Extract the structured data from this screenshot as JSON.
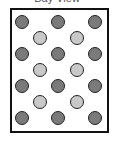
{
  "title": "Bay View",
  "colors": {
    "dark": "#7a7a7a",
    "light": "#c8c8c8",
    "border": "#111111"
  },
  "dots": [
    {
      "type": "dark",
      "x": 22,
      "y": 22
    },
    {
      "type": "dark",
      "x": 58,
      "y": 22
    },
    {
      "type": "dark",
      "x": 95,
      "y": 22
    },
    {
      "type": "light",
      "x": 40,
      "y": 38
    },
    {
      "type": "light",
      "x": 77,
      "y": 38
    },
    {
      "type": "dark",
      "x": 22,
      "y": 54
    },
    {
      "type": "dark",
      "x": 58,
      "y": 54
    },
    {
      "type": "dark",
      "x": 95,
      "y": 54
    },
    {
      "type": "light",
      "x": 40,
      "y": 70
    },
    {
      "type": "light",
      "x": 77,
      "y": 70
    },
    {
      "type": "dark",
      "x": 22,
      "y": 86
    },
    {
      "type": "dark",
      "x": 58,
      "y": 86
    },
    {
      "type": "dark",
      "x": 95,
      "y": 86
    },
    {
      "type": "light",
      "x": 40,
      "y": 102
    },
    {
      "type": "light",
      "x": 77,
      "y": 102
    },
    {
      "type": "dark",
      "x": 22,
      "y": 118
    },
    {
      "type": "dark",
      "x": 58,
      "y": 118
    },
    {
      "type": "dark",
      "x": 95,
      "y": 118
    }
  ]
}
